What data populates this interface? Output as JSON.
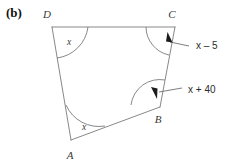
{
  "figure": {
    "part_label": "(b)",
    "shape": "quadrilateral",
    "vertices": [
      {
        "name": "A",
        "label": "A",
        "x": 71,
        "y": 140
      },
      {
        "name": "B",
        "label": "B",
        "x": 160,
        "y": 107
      },
      {
        "name": "C",
        "label": "C",
        "x": 175,
        "y": 27
      },
      {
        "name": "D",
        "label": "D",
        "x": 52,
        "y": 27
      }
    ],
    "vertex_label_positions": [
      {
        "name": "A",
        "x": 67,
        "y": 158
      },
      {
        "name": "B",
        "x": 157,
        "y": 122
      },
      {
        "name": "C",
        "x": 170,
        "y": 18
      },
      {
        "name": "D",
        "x": 47,
        "y": 18
      }
    ],
    "angles": [
      {
        "at": "D",
        "label": "x",
        "label_x": 69,
        "label_y": 44,
        "has_arrow": false
      },
      {
        "at": "A",
        "label": "x",
        "label_x": 84,
        "label_y": 129,
        "has_arrow": false
      },
      {
        "at": "C",
        "label": "x – 5",
        "label_x": 196,
        "label_y": 49,
        "has_arrow": true
      },
      {
        "at": "B",
        "label": "x + 40",
        "label_x": 188,
        "label_y": 93,
        "has_arrow": true
      }
    ],
    "callouts": [
      {
        "id": "angle-c-callout",
        "text_prefix": "x",
        "operator": "–",
        "text_suffix": "5",
        "full": "x – 5"
      },
      {
        "id": "angle-b-callout",
        "text_prefix": "x",
        "operator": "+",
        "text_suffix": "40",
        "full": "x + 40"
      }
    ],
    "colors": {
      "background": "#ffffff",
      "stroke": "#7a7a7a",
      "arrow": "#1c1c1c",
      "text": "#2b2b2b",
      "label_text": "#3a3a3a"
    }
  }
}
